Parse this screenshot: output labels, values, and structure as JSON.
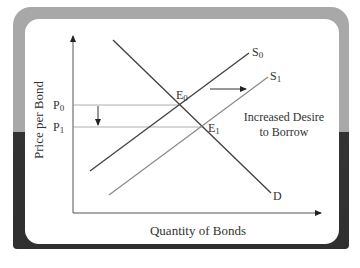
{
  "diagram": {
    "axes": {
      "y_label": "Price per Bond",
      "x_label": "Quantity of Bonds"
    },
    "price_levels": [
      {
        "label": "P",
        "sub": "0"
      },
      {
        "label": "P",
        "sub": "1"
      }
    ],
    "curves": {
      "supply_0": {
        "label": "S",
        "sub": "0"
      },
      "supply_1": {
        "label": "S",
        "sub": "1"
      },
      "demand": {
        "label": "D"
      }
    },
    "equilibria": [
      {
        "label": "E",
        "sub": "0"
      },
      {
        "label": "E",
        "sub": "1"
      }
    ],
    "annotation": {
      "line1": "Increased Desire",
      "line2": "to Borrow"
    },
    "colors": {
      "frame_top": "#a8a8a8",
      "frame_bottom": "#333333",
      "panel": "#ffffff",
      "demand_line": "#444444",
      "supply_0_line": "#444444",
      "supply_1_line": "#8a8a8a",
      "guide_line": "#9a9a9a"
    }
  }
}
